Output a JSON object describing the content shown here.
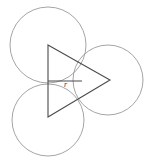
{
  "figure": {
    "width": 152,
    "height": 161,
    "background_color": "#ffffff",
    "circle_stroke_color": "#9a9a9a",
    "line_stroke_color": "#4a4a4a",
    "labels": {
      "radius": "r"
    },
    "circles": [
      {
        "name": "top-left-circle",
        "cx": 48,
        "cy": 45,
        "r": 38
      },
      {
        "name": "right-circle",
        "cx": 108,
        "cy": 80,
        "r": 35
      },
      {
        "name": "bottom-left-circle",
        "cx": 48,
        "cy": 120,
        "r": 36
      }
    ],
    "triangle": {
      "name": "center-triangle",
      "points": "48,45 110,80 48,117",
      "vertices": [
        {
          "label": "top-left-vertex",
          "x": 48,
          "y": 45
        },
        {
          "label": "right-vertex",
          "x": 110,
          "y": 80
        },
        {
          "label": "bottom-left-vertex",
          "x": 48,
          "y": 117
        }
      ]
    },
    "radius_segment": {
      "name": "radius-segment",
      "x1": 48,
      "y1": 81,
      "x2": 82,
      "y2": 81
    },
    "radius_label_position": {
      "x": 64,
      "y": 87
    }
  }
}
